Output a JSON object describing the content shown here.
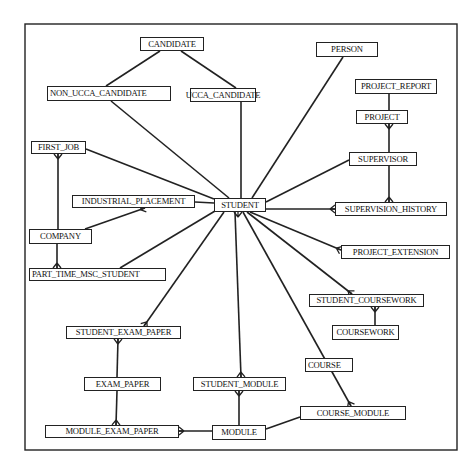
{
  "diagram": {
    "type": "entity-relationship",
    "frame": {
      "x": 25,
      "y": 24,
      "w": 432,
      "h": 426
    },
    "colors": {
      "line": "#222222",
      "box_border": "#222222",
      "background": "#ffffff",
      "text": "#111111"
    },
    "entities": [
      {
        "id": "candidate",
        "label": "CANDIDATE",
        "x": 140,
        "y": 37,
        "w": 64,
        "h": 14
      },
      {
        "id": "non_ucca_candidate",
        "label": "NON_UCCA_CANDIDATE",
        "x": 47,
        "y": 86,
        "w": 124,
        "h": 15,
        "align": "left"
      },
      {
        "id": "ucca_candidate",
        "label": "UCCA_CANDIDATE",
        "x": 190,
        "y": 88,
        "w": 66,
        "h": 14
      },
      {
        "id": "person",
        "label": "PERSON",
        "x": 316,
        "y": 42,
        "w": 62,
        "h": 15
      },
      {
        "id": "project_report",
        "label": "PROJECT_REPORT",
        "x": 355,
        "y": 79,
        "w": 82,
        "h": 15
      },
      {
        "id": "project",
        "label": "PROJECT",
        "x": 356,
        "y": 110,
        "w": 52,
        "h": 14
      },
      {
        "id": "supervisor",
        "label": "SUPERVISOR",
        "x": 349,
        "y": 152,
        "w": 68,
        "h": 14
      },
      {
        "id": "first_job",
        "label": "FIRST_JOB",
        "x": 31,
        "y": 141,
        "w": 55,
        "h": 13
      },
      {
        "id": "industrial_placement",
        "label": "INDUSTRIAL_PLACEMENT",
        "x": 72,
        "y": 195,
        "w": 123,
        "h": 13
      },
      {
        "id": "student",
        "label": "STUDENT",
        "x": 214,
        "y": 198,
        "w": 52,
        "h": 14
      },
      {
        "id": "supervision_history",
        "label": "SUPERVISION_HISTORY",
        "x": 335,
        "y": 202,
        "w": 112,
        "h": 14
      },
      {
        "id": "company",
        "label": "COMPANY",
        "x": 29,
        "y": 229,
        "w": 63,
        "h": 15
      },
      {
        "id": "project_extension",
        "label": "PROJECT_EXTENSION",
        "x": 341,
        "y": 245,
        "w": 109,
        "h": 14
      },
      {
        "id": "part_time_msc_student",
        "label": "PART_TIME_MSC_STUDENT",
        "x": 29,
        "y": 268,
        "w": 137,
        "h": 13,
        "align": "left"
      },
      {
        "id": "student_coursework",
        "label": "STUDENT_COURSEWORK",
        "x": 309,
        "y": 294,
        "w": 115,
        "h": 13
      },
      {
        "id": "coursework",
        "label": "COURSEWORK",
        "x": 332,
        "y": 325,
        "w": 67,
        "h": 15
      },
      {
        "id": "student_exam_paper",
        "label": "STUDENT_EXAM_PAPER",
        "x": 66,
        "y": 326,
        "w": 115,
        "h": 13
      },
      {
        "id": "course",
        "label": "COURSE",
        "x": 305,
        "y": 358,
        "w": 48,
        "h": 14,
        "align": "left"
      },
      {
        "id": "exam_paper",
        "label": "EXAM_PAPER",
        "x": 84,
        "y": 377,
        "w": 77,
        "h": 14
      },
      {
        "id": "student_module",
        "label": "STUDENT_MODULE",
        "x": 193,
        "y": 377,
        "w": 93,
        "h": 14
      },
      {
        "id": "course_module",
        "label": "COURSE_MODULE",
        "x": 300,
        "y": 406,
        "w": 106,
        "h": 14
      },
      {
        "id": "module_exam_paper",
        "label": "MODULE_EXAM_PAPER",
        "x": 45,
        "y": 425,
        "w": 134,
        "h": 13
      },
      {
        "id": "module",
        "label": "MODULE",
        "x": 212,
        "y": 425,
        "w": 54,
        "h": 15
      }
    ],
    "relationships": [
      {
        "from": "candidate",
        "to": "non_ucca_candidate",
        "x1": 160,
        "y1": 51,
        "x2": 106,
        "y2": 86
      },
      {
        "from": "candidate",
        "to": "ucca_candidate",
        "x1": 181,
        "y1": 51,
        "x2": 236,
        "y2": 88
      },
      {
        "from": "non_ucca_candidate",
        "to": "student",
        "x1": 111,
        "y1": 101,
        "x2": 229,
        "y2": 198
      },
      {
        "from": "ucca_candidate",
        "to": "student",
        "x1": 241,
        "y1": 102,
        "x2": 241,
        "y2": 198
      },
      {
        "from": "person",
        "to": "student",
        "x1": 343,
        "y1": 57,
        "x2": 252,
        "y2": 198
      },
      {
        "from": "project_report",
        "to": "project",
        "x1": 389,
        "y1": 94,
        "x2": 389,
        "y2": 110
      },
      {
        "from": "project",
        "to": "supervisor",
        "x1": 389,
        "y1": 124,
        "x2": 389,
        "y2": 152,
        "end_from": "crowfoot"
      },
      {
        "from": "supervisor",
        "to": "student",
        "x1": 349,
        "y1": 160,
        "x2": 266,
        "y2": 202
      },
      {
        "from": "supervisor",
        "to": "supervision_history",
        "x1": 389,
        "y1": 166,
        "x2": 389,
        "y2": 202,
        "end_to": "crowfoot"
      },
      {
        "from": "student",
        "to": "supervision_history",
        "x1": 266,
        "y1": 209,
        "x2": 335,
        "y2": 209,
        "end_to": "crowfoot"
      },
      {
        "from": "first_job",
        "to": "student",
        "x1": 86,
        "y1": 149,
        "x2": 214,
        "y2": 199
      },
      {
        "from": "first_job",
        "to": "company",
        "x1": 58,
        "y1": 154,
        "x2": 58,
        "y2": 229,
        "end_from": "crowfoot"
      },
      {
        "from": "industrial_placement",
        "to": "student",
        "x1": 195,
        "y1": 202,
        "x2": 214,
        "y2": 203
      },
      {
        "from": "industrial_placement",
        "to": "company",
        "x1": 145,
        "y1": 208,
        "x2": 85,
        "y2": 229,
        "end_from": "crowfoot"
      },
      {
        "from": "company",
        "to": "part_time_msc_student",
        "x1": 57,
        "y1": 244,
        "x2": 57,
        "y2": 268,
        "end_to": "crowfoot"
      },
      {
        "from": "part_time_msc_student",
        "to": "student",
        "x1": 120,
        "y1": 268,
        "x2": 215,
        "y2": 211
      },
      {
        "from": "student",
        "to": "project_extension",
        "x1": 250,
        "y1": 212,
        "x2": 341,
        "y2": 250,
        "end_to": "crowfoot"
      },
      {
        "from": "student",
        "to": "student_coursework",
        "x1": 247,
        "y1": 212,
        "x2": 352,
        "y2": 294,
        "end_to": "crowfoot"
      },
      {
        "from": "student_coursework",
        "to": "coursework",
        "x1": 375,
        "y1": 307,
        "x2": 375,
        "y2": 325,
        "end_from": "crowfoot"
      },
      {
        "from": "student",
        "to": "student_exam_paper",
        "x1": 224,
        "y1": 212,
        "x2": 144,
        "y2": 326,
        "end_to": "crowfoot"
      },
      {
        "from": "student_exam_paper",
        "to": "exam_paper",
        "x1": 118,
        "y1": 339,
        "x2": 117,
        "y2": 377,
        "end_from": "crowfoot"
      },
      {
        "from": "exam_paper",
        "to": "module_exam_paper",
        "x1": 117,
        "y1": 391,
        "x2": 116,
        "y2": 425,
        "end_to": "crowfoot"
      },
      {
        "from": "student",
        "to": "student_module",
        "x1": 235,
        "y1": 212,
        "x2": 241,
        "y2": 377,
        "end_to": "crowfoot"
      },
      {
        "from": "student_module",
        "to": "module",
        "x1": 239,
        "y1": 391,
        "x2": 239,
        "y2": 425,
        "end_from": "crowfoot"
      },
      {
        "from": "module",
        "to": "module_exam_paper",
        "x1": 212,
        "y1": 431,
        "x2": 179,
        "y2": 431,
        "end_to": "crowfoot"
      },
      {
        "from": "student",
        "to": "course_module",
        "x1": 243,
        "y1": 212,
        "x2": 351,
        "y2": 406,
        "end_to": "crowfoot"
      },
      {
        "from": "module",
        "to": "course_module",
        "x1": 266,
        "y1": 429,
        "x2": 300,
        "y2": 417
      },
      {
        "from": "student",
        "to": "student_crowfoot",
        "x1": 238,
        "y1": 212,
        "x2": 238,
        "y2": 212,
        "end_from": "crowfoot-down"
      }
    ]
  }
}
